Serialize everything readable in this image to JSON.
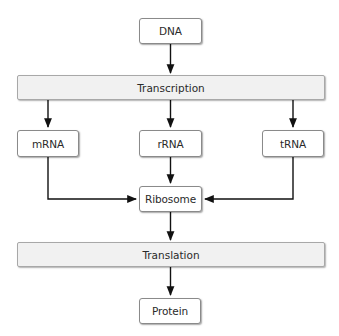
{
  "diagram": {
    "type": "flowchart",
    "title": "",
    "nodes": {
      "dna": {
        "label": "DNA"
      },
      "transcription": {
        "label": "Transcription"
      },
      "mrna": {
        "label": "mRNA"
      },
      "rrna": {
        "label": "rRNA"
      },
      "trna": {
        "label": "tRNA"
      },
      "ribosome": {
        "label": "Ribosome"
      },
      "translation": {
        "label": "Translation"
      },
      "protein": {
        "label": "Protein"
      }
    },
    "edges": [
      {
        "from": "DNA",
        "to": "Transcription"
      },
      {
        "from": "Transcription",
        "to": "mRNA"
      },
      {
        "from": "Transcription",
        "to": "rRNA"
      },
      {
        "from": "Transcription",
        "to": "tRNA"
      },
      {
        "from": "mRNA",
        "to": "Ribosome"
      },
      {
        "from": "rRNA",
        "to": "Ribosome"
      },
      {
        "from": "tRNA",
        "to": "Ribosome"
      },
      {
        "from": "Ribosome",
        "to": "Translation"
      },
      {
        "from": "Translation",
        "to": "Protein"
      }
    ],
    "colors": {
      "box_fill": "#ffffff",
      "bar_fill": "#f1f1f1",
      "border": "#8a8a8a",
      "arrow": "#111111",
      "text": "#2a2a2a"
    }
  }
}
